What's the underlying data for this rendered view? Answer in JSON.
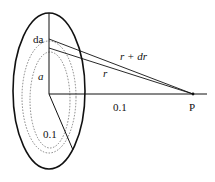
{
  "diagram": {
    "type": "geometry",
    "labels": {
      "ring_width": "da",
      "ring_radius": "a",
      "distance": "r",
      "distance_plus": "r + dr",
      "axis_distance": "0.1",
      "inner_radius": "0.1",
      "point": "P"
    },
    "colors": {
      "stroke": "#111111",
      "dotted": "#555555",
      "background": "#ffffff"
    }
  }
}
